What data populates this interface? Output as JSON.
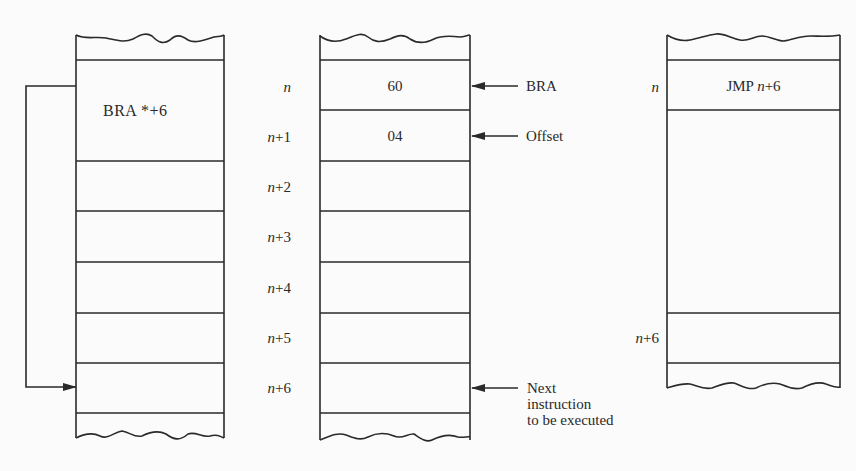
{
  "diagram": {
    "colors": {
      "line": "#2a2a2a",
      "background": "#fbfbfb"
    },
    "left_column": {
      "instruction": "BRA *+6",
      "instruction_parts": {
        "op": "BRA",
        "operand": "*+6"
      },
      "loop_arrow": "branch-to-n+6"
    },
    "middle_column": {
      "cells": [
        {
          "address": "n",
          "value": "60",
          "pointer_label": "BRA"
        },
        {
          "address": "n+1",
          "value": "04",
          "pointer_label": "Offset"
        },
        {
          "address": "n+2",
          "value": ""
        },
        {
          "address": "n+3",
          "value": ""
        },
        {
          "address": "n+4",
          "value": ""
        },
        {
          "address": "n+5",
          "value": ""
        },
        {
          "address": "n+6",
          "value": "",
          "pointer_label": "Next instruction to be executed"
        }
      ],
      "addr_parts": [
        {
          "var": "n",
          "suffix": ""
        },
        {
          "var": "n",
          "suffix": "+1"
        },
        {
          "var": "n",
          "suffix": "+2"
        },
        {
          "var": "n",
          "suffix": "+3"
        },
        {
          "var": "n",
          "suffix": "+4"
        },
        {
          "var": "n",
          "suffix": "+5"
        },
        {
          "var": "n",
          "suffix": "+6"
        }
      ],
      "next_note_lines": [
        "Next",
        "instruction",
        "to be executed"
      ]
    },
    "right_column": {
      "top_address": {
        "var": "n",
        "suffix": ""
      },
      "instruction": {
        "op": "JMP ",
        "var": "n",
        "suffix": "+6"
      },
      "bottom_address": {
        "var": "n",
        "suffix": "+6"
      }
    }
  }
}
